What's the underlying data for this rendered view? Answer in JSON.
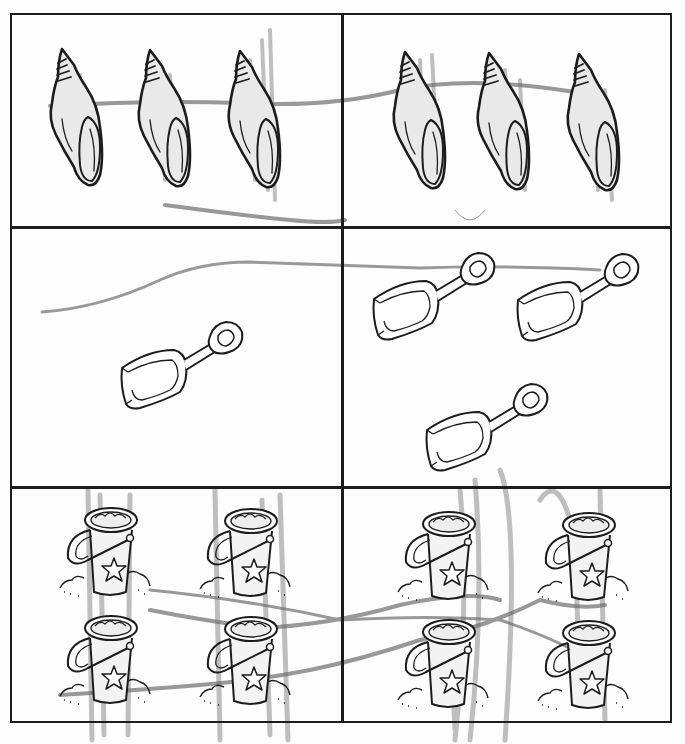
{
  "worksheet": {
    "type": "count-and-match picture worksheet (scanned, colored with pencil)",
    "layout": {
      "rows": 3,
      "columns": 2
    },
    "rows": [
      {
        "item": "seashell",
        "left_count": 3,
        "right_count": 3,
        "icons": {
          "left": "seashell-icon",
          "right": "seashell-icon"
        }
      },
      {
        "item": "shovel",
        "left_count": 1,
        "right_count": 3,
        "icons": {
          "left": "shovel-icon",
          "right": "shovel-icon"
        }
      },
      {
        "item": "sand bucket",
        "left_count": 4,
        "right_count": 4,
        "icons": {
          "left": "bucket-icon",
          "right": "bucket-icon"
        }
      }
    ],
    "pencil_marks": {
      "color": "#8a8a8a",
      "description": "gray pencil scribbles and connecting lines across cells"
    },
    "colors": {
      "ink": "#1c1c1c",
      "paper": "#fdfdfd",
      "pencil": "#8a8a8a"
    }
  }
}
